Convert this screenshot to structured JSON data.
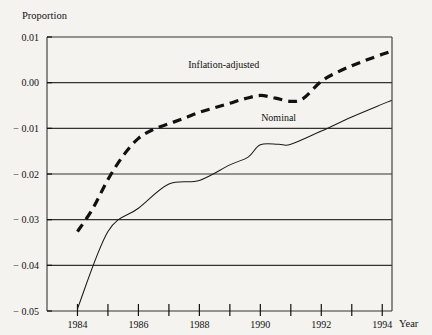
{
  "chart_data": {
    "type": "line",
    "title": "",
    "ylabel": "Proportion",
    "xlabel": "Year",
    "ylim": [
      -0.05,
      0.01
    ],
    "xlim": [
      1983.0,
      1994.32
    ],
    "grid": true,
    "legend_position": "inline-annotation",
    "ytick_labels": [
      "0.01",
      "0.00",
      "− 0.01",
      "− 0.02",
      "− 0.03",
      "− 0.04",
      "− 0.05"
    ],
    "ytick_values": [
      0.01,
      0.0,
      -0.01,
      -0.02,
      -0.03,
      -0.04,
      -0.05
    ],
    "xtick_values": [
      1984,
      1985,
      1986,
      1987,
      1988,
      1989,
      1990,
      1991,
      1992,
      1993,
      1994
    ],
    "xtick_labels": [
      "1984",
      "",
      "1986",
      "",
      "1988",
      "",
      "1990",
      "",
      "1992",
      "",
      "1994"
    ],
    "xtick_labels_shown": [
      "1984",
      "1986",
      "1988",
      "1990",
      "1992",
      "1994"
    ],
    "series": [
      {
        "name": "Inflation-adjusted",
        "style": "dashed",
        "label_x": 1988.8,
        "label_y": 0.0033,
        "x": [
          1984.0,
          1984.5,
          1985.0,
          1985.5,
          1986.0,
          1986.5,
          1987.0,
          1987.5,
          1988.0,
          1988.5,
          1989.0,
          1989.5,
          1990.0,
          1990.5,
          1991.0,
          1991.4,
          1992.0,
          1992.5,
          1993.0,
          1993.5,
          1994.0,
          1994.3
        ],
        "y": [
          -0.0326,
          -0.0276,
          -0.0212,
          -0.016,
          -0.0122,
          -0.0102,
          -0.009,
          -0.0078,
          -0.0065,
          -0.0055,
          -0.0045,
          -0.0035,
          -0.0028,
          -0.0034,
          -0.0041,
          -0.0035,
          0.0003,
          0.0022,
          0.0037,
          0.005,
          0.0062,
          0.0069
        ]
      },
      {
        "name": "Nominal",
        "style": "solid",
        "label_x": 1990.6,
        "label_y": -0.0084,
        "x": [
          1984.0,
          1985.0,
          1986.0,
          1987.0,
          1988.0,
          1989.0,
          1989.6,
          1990.0,
          1990.6,
          1991.0,
          1992.0,
          1993.0,
          1994.0,
          1994.3
        ],
        "y": [
          -0.0495,
          -0.0326,
          -0.0275,
          -0.0222,
          -0.0214,
          -0.018,
          -0.0163,
          -0.0136,
          -0.0135,
          -0.0135,
          -0.0106,
          -0.0075,
          -0.0047,
          -0.0039
        ]
      }
    ]
  },
  "labels": {
    "y_axis_title": "Proportion",
    "x_axis_title": "Year",
    "series_inflation": "Inflation-adjusted",
    "series_nominal": "Nominal"
  },
  "colors": {
    "background": "#f4f3ef",
    "ink": "#111111",
    "grid": "#333333"
  }
}
